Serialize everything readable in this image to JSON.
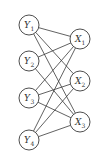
{
  "diagram": {
    "type": "bipartite-graph",
    "left_nodes": [
      {
        "id": "Y1",
        "base": "Y",
        "sub": "1",
        "cx": 29,
        "cy": 25
      },
      {
        "id": "Y2",
        "base": "Y",
        "sub": "2",
        "cx": 29,
        "cy": 61
      },
      {
        "id": "Y3",
        "base": "Y",
        "sub": "3",
        "cx": 29,
        "cy": 98
      },
      {
        "id": "Y4",
        "base": "Y",
        "sub": "4",
        "cx": 29,
        "cy": 140
      }
    ],
    "right_nodes": [
      {
        "id": "X1",
        "base": "X",
        "sub": "1",
        "cx": 80,
        "cy": 39
      },
      {
        "id": "X2",
        "base": "X",
        "sub": "2",
        "cx": 80,
        "cy": 81
      },
      {
        "id": "X3",
        "base": "X",
        "sub": "3",
        "cx": 80,
        "cy": 122
      }
    ],
    "edges": [
      [
        "Y1",
        "X1"
      ],
      [
        "Y1",
        "X2"
      ],
      [
        "Y1",
        "X3"
      ],
      [
        "Y2",
        "X1"
      ],
      [
        "Y2",
        "X3"
      ],
      [
        "Y3",
        "X1"
      ],
      [
        "Y3",
        "X2"
      ],
      [
        "Y3",
        "X3"
      ],
      [
        "Y4",
        "X1"
      ],
      [
        "Y4",
        "X2"
      ],
      [
        "Y4",
        "X3"
      ]
    ],
    "node_radius": 10
  }
}
